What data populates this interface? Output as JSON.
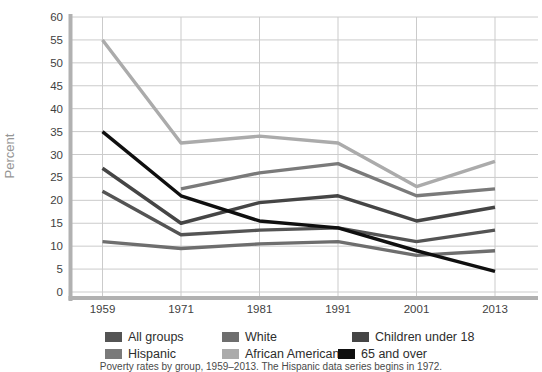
{
  "chart_data": {
    "type": "line",
    "title": "",
    "xlabel": "",
    "ylabel": "Percent",
    "x_categories": [
      "1959",
      "1971",
      "1981",
      "1991",
      "2001",
      "2013"
    ],
    "ylim": [
      0,
      60
    ],
    "ytick_step": 5,
    "yticks": [
      60,
      55,
      50,
      45,
      40,
      35,
      30,
      25,
      20,
      15,
      10,
      5,
      0
    ],
    "grid": "on",
    "legend_position": "bottom",
    "series": [
      {
        "name": "All groups",
        "color": "#545454",
        "values": [
          22,
          12.5,
          13.5,
          14,
          11,
          13.5
        ]
      },
      {
        "name": "White",
        "color": "#6e6e6e",
        "values": [
          11,
          9.5,
          10.5,
          11,
          8,
          9
        ]
      },
      {
        "name": "Children under 18",
        "color": "#454545",
        "values": [
          27,
          15,
          19.5,
          21,
          15.5,
          18.5
        ]
      },
      {
        "name": "Hispanic",
        "color": "#7a7a7a",
        "values": [
          null,
          22.5,
          26,
          28,
          21,
          22.5
        ]
      },
      {
        "name": "African American",
        "color": "#ababab",
        "values": [
          55,
          32.5,
          34,
          32.5,
          23,
          28.5
        ]
      },
      {
        "name": "65 and over",
        "color": "#0f0f0f",
        "values": [
          35,
          21,
          15.5,
          14,
          9,
          4.5
        ]
      }
    ]
  },
  "style_colors": {
    "axis": "#b1b1b1",
    "gridline": "#cbcbcb",
    "tick_label": "#3f3f3f",
    "axis_title": "#959595"
  },
  "caption": "Poverty rates by group, 1959–2013. The Hispanic data series begins in 1972."
}
